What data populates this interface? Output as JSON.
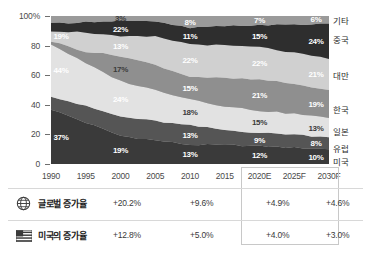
{
  "chart_data": {
    "type": "area",
    "stacked": "100%",
    "title": "",
    "xlabel": "",
    "ylabel": "",
    "ylim": [
      0,
      100
    ],
    "grid": false,
    "legend_position": "right",
    "categories": [
      "1990",
      "1995",
      "2000",
      "2005",
      "2010",
      "2015",
      "2020E",
      "2025F",
      "2030F"
    ],
    "x_tick_labels": [
      "1990",
      "1995",
      "2000",
      "2005",
      "2010",
      "2015",
      "2020E",
      "2025F",
      "2030F"
    ],
    "y_tick_labels": [
      "100%",
      "80",
      "60",
      "40",
      "20",
      "0"
    ],
    "y_tick_values": [
      100,
      80,
      60,
      40,
      20,
      0
    ],
    "series": [
      {
        "name": "미국",
        "color": "#3a3a3a",
        "values": [
          37,
          28,
          19,
          16,
          13,
          13,
          12,
          11,
          10
        ]
      },
      {
        "name": "유럽",
        "color": "#555555",
        "values": [
          9,
          11,
          13,
          13,
          13,
          10,
          9,
          9,
          8
        ]
      },
      {
        "name": "일본",
        "color": "#e2e2e2",
        "values": [
          35,
          29,
          24,
          21,
          18,
          16,
          15,
          14,
          13
        ]
      },
      {
        "name": "한국",
        "color": "#8f8f8f",
        "values": [
          2,
          8,
          17,
          17,
          15,
          19,
          21,
          20,
          19
        ]
      },
      {
        "name": "대만",
        "color": "#d0d0d0",
        "values": [
          7,
          13,
          13,
          19,
          22,
          22,
          22,
          21,
          21
        ]
      },
      {
        "name": "중국",
        "color": "#2e2e2e",
        "values": [
          5,
          7,
          11,
          10,
          11,
          13,
          15,
          19,
          24
        ]
      },
      {
        "name": "기타",
        "color": "#9a9a9a",
        "values": [
          5,
          4,
          3,
          4,
          8,
          7,
          7,
          6,
          6
        ]
      }
    ],
    "point_labels": [
      {
        "text": "19%",
        "series": "대만",
        "category": "1990",
        "tone": "light"
      },
      {
        "text": "44%",
        "series": "일본",
        "category": "1990",
        "tone": "light"
      },
      {
        "text": "37%",
        "series": "미국",
        "category": "1990",
        "tone": "light"
      },
      {
        "text": "3%",
        "series": "기타",
        "category": "2000",
        "tone": "dark"
      },
      {
        "text": "22%",
        "series": "중국",
        "category": "2000",
        "tone": "light"
      },
      {
        "text": "13%",
        "series": "대만",
        "category": "2000",
        "tone": "light"
      },
      {
        "text": "17%",
        "series": "한국",
        "category": "2000",
        "tone": "dark"
      },
      {
        "text": "24%",
        "series": "일본",
        "category": "2000",
        "tone": "light"
      },
      {
        "text": "19%",
        "series": "미국",
        "category": "2000",
        "tone": "light"
      },
      {
        "text": "8%",
        "series": "기타",
        "category": "2010",
        "tone": "light"
      },
      {
        "text": "11%",
        "series": "중국",
        "category": "2010",
        "tone": "light"
      },
      {
        "text": "22%",
        "series": "대만",
        "category": "2010",
        "tone": "light"
      },
      {
        "text": "15%",
        "series": "한국",
        "category": "2010",
        "tone": "light"
      },
      {
        "text": "18%",
        "series": "일본",
        "category": "2010",
        "tone": "dark"
      },
      {
        "text": "13%",
        "series": "유럽",
        "category": "2010",
        "tone": "light"
      },
      {
        "text": "13%",
        "series": "미국",
        "category": "2010",
        "tone": "light"
      },
      {
        "text": "7%",
        "series": "기타",
        "category": "2020E",
        "tone": "light"
      },
      {
        "text": "15%",
        "series": "중국",
        "category": "2020E",
        "tone": "light"
      },
      {
        "text": "22%",
        "series": "대만",
        "category": "2020E",
        "tone": "light"
      },
      {
        "text": "21%",
        "series": "한국",
        "category": "2020E",
        "tone": "light"
      },
      {
        "text": "15%",
        "series": "일본",
        "category": "2020E",
        "tone": "dark"
      },
      {
        "text": "9%",
        "series": "유럽",
        "category": "2020E",
        "tone": "light"
      },
      {
        "text": "12%",
        "series": "미국",
        "category": "2020E",
        "tone": "light"
      },
      {
        "text": "6%",
        "series": "기타",
        "category": "2030F",
        "tone": "light"
      },
      {
        "text": "24%",
        "series": "중국",
        "category": "2030F",
        "tone": "light"
      },
      {
        "text": "21%",
        "series": "대만",
        "category": "2030F",
        "tone": "light"
      },
      {
        "text": "19%",
        "series": "한국",
        "category": "2030F",
        "tone": "light"
      },
      {
        "text": "13%",
        "series": "일본",
        "category": "2030F",
        "tone": "dark"
      },
      {
        "text": "8%",
        "series": "유럽",
        "category": "2030F",
        "tone": "light"
      },
      {
        "text": "10%",
        "series": "미국",
        "category": "2030F",
        "tone": "light"
      }
    ]
  },
  "chart": {
    "y_ticks": [
      {
        "label": "100%",
        "value": 100
      },
      {
        "label": "80",
        "value": 80
      },
      {
        "label": "60",
        "value": 60
      },
      {
        "label": "40",
        "value": 40
      },
      {
        "label": "20",
        "value": 20
      },
      {
        "label": "0",
        "value": 0
      }
    ],
    "x_ticks": [
      {
        "label": "1990",
        "index": 0
      },
      {
        "label": "1995",
        "index": 1
      },
      {
        "label": "2000",
        "index": 2
      },
      {
        "label": "2005",
        "index": 3
      },
      {
        "label": "2010",
        "index": 4
      },
      {
        "label": "2015",
        "index": 5
      },
      {
        "label": "2020E",
        "index": 6
      },
      {
        "label": "2025F",
        "index": 7
      },
      {
        "label": "2030F",
        "index": 8
      }
    ],
    "legend": [
      {
        "label": "기타",
        "y": 20
      },
      {
        "label": "중국",
        "y": 39
      },
      {
        "label": "대만",
        "y": 75
      },
      {
        "label": "한국",
        "y": 109
      },
      {
        "label": "일본",
        "y": 131
      },
      {
        "label": "유럽",
        "y": 148
      },
      {
        "label": "미국",
        "y": 161
      }
    ]
  },
  "table": {
    "rows": [
      {
        "icon": "globe-icon",
        "label": "글로벌 증가율",
        "values": [
          "+20.2%",
          "+9.6%",
          "+4.9%",
          "+4.6%"
        ]
      },
      {
        "icon": "us-flag-icon",
        "label": "미국의 증가율",
        "values": [
          "+12.8%",
          "+5.0%",
          "+4.0%",
          "+3.0%"
        ]
      }
    ],
    "value_x": [
      105,
      182,
      258,
      318
    ]
  },
  "colors": {
    "background": "#ffffff",
    "axis": "#6e6e6e",
    "text": "#3a3a3a",
    "forecast_box_border": "#c8c8c8",
    "row_separator": "#d8d8d8"
  }
}
